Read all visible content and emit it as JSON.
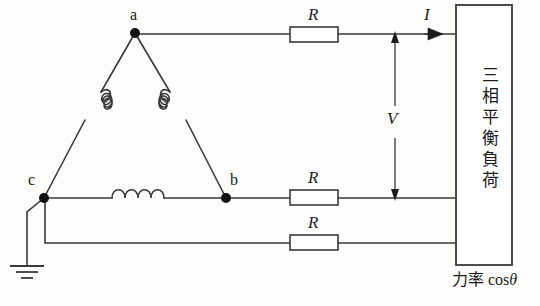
{
  "diagram": {
    "nodes": [
      {
        "id": "a",
        "label": "a",
        "x": 135,
        "y": 33
      },
      {
        "id": "b",
        "label": "b",
        "x": 226,
        "y": 198
      },
      {
        "id": "c",
        "label": "c",
        "x": 44,
        "y": 198
      }
    ],
    "resistors": [
      {
        "label": "R",
        "x": 290,
        "y": 27,
        "w": 48,
        "h": 15
      },
      {
        "label": "R",
        "x": 290,
        "y": 190,
        "w": 48,
        "h": 15
      },
      {
        "label": "R",
        "x": 290,
        "y": 235,
        "w": 48,
        "h": 15
      }
    ],
    "current_label": "I",
    "voltage_label": "V",
    "load_box": {
      "text": "三相平衡負荷",
      "x": 456,
      "y": 5,
      "w": 56,
      "h": 260
    },
    "power_factor": {
      "prefix": "力率",
      "expression": "cos",
      "symbol": "θ"
    },
    "ground_label": "",
    "colors": {
      "line": "#3a3a38",
      "node": "#111111",
      "background": "#fdfdfb",
      "text": "#1a1a1a"
    }
  }
}
